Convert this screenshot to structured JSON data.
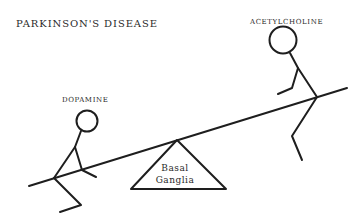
{
  "title": "PARKINSON'S DISEASE",
  "figures": {
    "left": {
      "label": "DOPAMINE",
      "position": "low side of seesaw"
    },
    "right": {
      "label": "ACETYLCHOLINE",
      "position": "high side of seesaw"
    }
  },
  "fulcrum": {
    "line1": "Basal",
    "line2": "Ganglia"
  },
  "colors": {
    "ink": "#1e1e1e",
    "background": "#ffffff"
  }
}
